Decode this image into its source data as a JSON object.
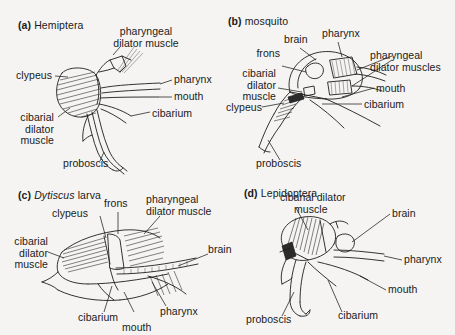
{
  "figure": {
    "type": "scientific-illustration",
    "background_color": "#f5f4f2",
    "ink_color": "#1d1d1d",
    "panel_count": 4
  },
  "panels": [
    {
      "id": "a",
      "letter": "(a)",
      "title": "Hemiptera",
      "title_italic": "",
      "labels": [
        {
          "name": "pharyngeal-dilator-muscle",
          "lines": [
            "pharyngeal",
            "dilator muscle"
          ]
        },
        {
          "name": "clypeus",
          "lines": [
            "clypeus"
          ]
        },
        {
          "name": "pharynx",
          "lines": [
            "pharynx"
          ]
        },
        {
          "name": "mouth",
          "lines": [
            "mouth"
          ]
        },
        {
          "name": "cibarium",
          "lines": [
            "cibarium"
          ]
        },
        {
          "name": "cibarial-dilator-muscle",
          "lines": [
            "cibarial",
            "dilator",
            "muscle"
          ]
        },
        {
          "name": "proboscis",
          "lines": [
            "proboscis"
          ]
        }
      ]
    },
    {
      "id": "b",
      "letter": "(b)",
      "title": "mosquito",
      "title_italic": "",
      "labels": [
        {
          "name": "brain",
          "lines": [
            "brain"
          ]
        },
        {
          "name": "pharynx",
          "lines": [
            "pharynx"
          ]
        },
        {
          "name": "frons",
          "lines": [
            "frons"
          ]
        },
        {
          "name": "pharyngeal-dilator-muscles",
          "lines": [
            "pharyngeal",
            "dilator muscles"
          ]
        },
        {
          "name": "cibarial-dilator-muscle",
          "lines": [
            "cibarial",
            "dilator",
            "muscle"
          ]
        },
        {
          "name": "mouth",
          "lines": [
            "mouth"
          ]
        },
        {
          "name": "cibarium",
          "lines": [
            "cibarium"
          ]
        },
        {
          "name": "clypeus",
          "lines": [
            "clypeus"
          ]
        },
        {
          "name": "proboscis",
          "lines": [
            "proboscis"
          ]
        }
      ]
    },
    {
      "id": "c",
      "letter": "(c)",
      "title": " larva",
      "title_italic": "Dytiscus",
      "labels": [
        {
          "name": "frons",
          "lines": [
            "frons"
          ]
        },
        {
          "name": "pharyngeal-dilator-muscle",
          "lines": [
            "pharyngeal",
            "dilator muscle"
          ]
        },
        {
          "name": "clypeus",
          "lines": [
            "clypeus"
          ]
        },
        {
          "name": "cibarial-dilator-muscle",
          "lines": [
            "cibarial",
            "dilator",
            "muscle"
          ]
        },
        {
          "name": "brain",
          "lines": [
            "brain"
          ]
        },
        {
          "name": "cibarium",
          "lines": [
            "cibarium"
          ]
        },
        {
          "name": "pharynx",
          "lines": [
            "pharynx"
          ]
        },
        {
          "name": "mouth",
          "lines": [
            "mouth"
          ]
        }
      ]
    },
    {
      "id": "d",
      "letter": "(d)",
      "title": "Lepidoptera",
      "title_italic": "",
      "labels": [
        {
          "name": "cibarial-dilator-muscle",
          "lines": [
            "cibarial dilator",
            "muscle"
          ]
        },
        {
          "name": "brain",
          "lines": [
            "brain"
          ]
        },
        {
          "name": "pharynx",
          "lines": [
            "pharynx"
          ]
        },
        {
          "name": "mouth",
          "lines": [
            "mouth"
          ]
        },
        {
          "name": "cibarium",
          "lines": [
            "cibarium"
          ]
        },
        {
          "name": "proboscis",
          "lines": [
            "proboscis"
          ]
        }
      ]
    }
  ],
  "text": {
    "a_pharyngeal_1": "pharyngeal",
    "a_pharyngeal_2": "dilator muscle",
    "a_clypeus": "clypeus",
    "a_pharynx": "pharynx",
    "a_mouth": "mouth",
    "a_cibarium": "cibarium",
    "a_cibarial_1": "cibarial",
    "a_cibarial_2": "dilator",
    "a_cibarial_3": "muscle",
    "a_proboscis": "proboscis",
    "b_brain": "brain",
    "b_pharynx": "pharynx",
    "b_frons": "frons",
    "b_phm_1": "pharyngeal",
    "b_phm_2": "dilator muscles",
    "b_cibarial_1": "cibarial",
    "b_cibarial_2": "dilator",
    "b_cibarial_3": "muscle",
    "b_mouth": "mouth",
    "b_cibarium": "cibarium",
    "b_clypeus": "clypeus",
    "b_proboscis": "proboscis",
    "c_frons": "frons",
    "c_phm_1": "pharyngeal",
    "c_phm_2": "dilator muscle",
    "c_clypeus": "clypeus",
    "c_cibarial_1": "cibarial",
    "c_cibarial_2": "dilator",
    "c_cibarial_3": "muscle",
    "c_brain": "brain",
    "c_cibarium": "cibarium",
    "c_pharynx": "pharynx",
    "c_mouth": "mouth",
    "d_cdm_1": "cibarial dilator",
    "d_cdm_2": "muscle",
    "d_brain": "brain",
    "d_pharynx": "pharynx",
    "d_mouth": "mouth",
    "d_cibarium": "cibarium",
    "d_proboscis": "proboscis"
  }
}
